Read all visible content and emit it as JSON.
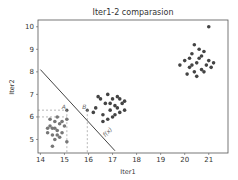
{
  "chart_data": {
    "type": "scatter",
    "title": "Iter1-2 comparasion",
    "xlabel": "Iter1",
    "ylabel": "Iter2",
    "xlim": [
      13.9,
      21.8
    ],
    "ylim": [
      4.4,
      10.3
    ],
    "xticks": [
      14,
      15,
      16,
      17,
      18,
      19,
      20,
      21
    ],
    "yticks": [
      5,
      6,
      7,
      8,
      9,
      10
    ],
    "grid": false,
    "series": [
      {
        "name": "cluster-low",
        "color": "#777777",
        "points": [
          [
            14.3,
            5.3
          ],
          [
            14.4,
            5.6
          ],
          [
            14.5,
            5.5
          ],
          [
            14.6,
            5.8
          ],
          [
            14.7,
            5.4
          ],
          [
            14.8,
            5.7
          ],
          [
            14.5,
            5.2
          ],
          [
            14.6,
            5.0
          ],
          [
            14.9,
            5.3
          ],
          [
            14.7,
            6.0
          ],
          [
            14.4,
            5.9
          ],
          [
            14.8,
            5.1
          ],
          [
            15.0,
            5.6
          ],
          [
            14.6,
            5.5
          ],
          [
            14.9,
            5.8
          ],
          [
            14.5,
            4.7
          ],
          [
            15.1,
            4.9
          ],
          [
            15.1,
            5.9
          ],
          [
            14.3,
            5.5
          ],
          [
            14.7,
            5.2
          ]
        ]
      },
      {
        "name": "cluster-mid",
        "color": "#444444",
        "points": [
          [
            16.3,
            6.4
          ],
          [
            16.5,
            6.8
          ],
          [
            16.7,
            6.6
          ],
          [
            16.8,
            7.0
          ],
          [
            16.9,
            6.3
          ],
          [
            17.0,
            6.8
          ],
          [
            17.1,
            6.5
          ],
          [
            17.2,
            6.9
          ],
          [
            17.3,
            6.2
          ],
          [
            17.4,
            6.6
          ],
          [
            16.6,
            6.1
          ],
          [
            16.8,
            5.9
          ],
          [
            17.0,
            6.0
          ],
          [
            17.2,
            6.4
          ],
          [
            17.5,
            6.7
          ],
          [
            16.4,
            6.9
          ],
          [
            16.6,
            5.8
          ],
          [
            17.1,
            6.1
          ],
          [
            17.3,
            6.8
          ],
          [
            16.9,
            6.6
          ],
          [
            16.2,
            6.2
          ],
          [
            17.5,
            6.3
          ]
        ]
      },
      {
        "name": "cluster-high",
        "color": "#444444",
        "points": [
          [
            20.0,
            8.5
          ],
          [
            20.2,
            8.2
          ],
          [
            20.3,
            8.8
          ],
          [
            20.4,
            8.0
          ],
          [
            20.5,
            8.4
          ],
          [
            20.6,
            8.6
          ],
          [
            20.7,
            8.1
          ],
          [
            20.8,
            8.9
          ],
          [
            20.9,
            8.3
          ],
          [
            21.0,
            8.5
          ],
          [
            21.1,
            8.2
          ],
          [
            20.2,
            8.6
          ],
          [
            20.4,
            9.2
          ],
          [
            20.6,
            9.0
          ],
          [
            20.8,
            8.0
          ],
          [
            21.2,
            8.4
          ],
          [
            19.8,
            8.3
          ],
          [
            20.1,
            7.9
          ],
          [
            20.5,
            7.8
          ],
          [
            21.0,
            10.0
          ],
          [
            20.3,
            8.3
          ],
          [
            20.7,
            8.7
          ]
        ]
      }
    ],
    "annotations": [
      {
        "type": "line",
        "from": [
          14.0,
          8.1
        ],
        "to": [
          17.1,
          4.5
        ],
        "label": "f(x)",
        "label_at": [
          16.7,
          5.1
        ]
      },
      {
        "type": "point",
        "label": "A",
        "at": [
          15.1,
          6.3
        ]
      },
      {
        "type": "point",
        "label": "B",
        "at": [
          15.95,
          6.3
        ]
      },
      {
        "type": "dashed-guide",
        "from": [
          13.9,
          6.3
        ],
        "to": [
          15.1,
          6.3
        ]
      },
      {
        "type": "dashed-guide",
        "from": [
          13.9,
          6.0
        ],
        "to": [
          15.1,
          6.0
        ]
      },
      {
        "type": "dashed-guide",
        "from": [
          15.1,
          6.3
        ],
        "to": [
          15.1,
          4.4
        ]
      },
      {
        "type": "dashed-guide",
        "from": [
          15.95,
          6.3
        ],
        "to": [
          15.95,
          4.4
        ]
      }
    ]
  }
}
